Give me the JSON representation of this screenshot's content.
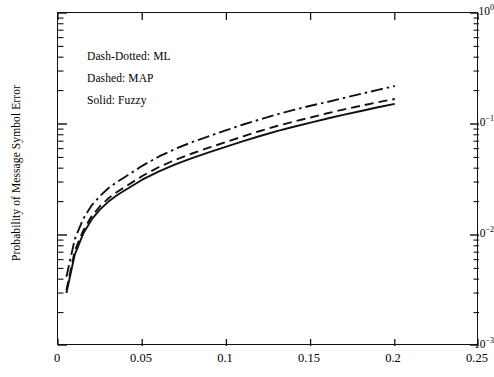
{
  "chart_data": {
    "type": "line",
    "title": "",
    "xlabel": "",
    "ylabel": "Probability of Message Symbol Error",
    "yscale": "log",
    "xscale": "linear",
    "xlim": [
      0,
      0.25
    ],
    "ylim": [
      0.001,
      1
    ],
    "xticks": [
      0,
      0.05,
      0.1,
      0.15,
      0.2,
      0.25
    ],
    "xticklabels": [
      "0",
      "0.05",
      "0.1",
      "0.15",
      "0.2",
      "0.25"
    ],
    "yticks": [
      1,
      0.1,
      0.01,
      0.001
    ],
    "yticklabels": [
      "10⁰",
      "10⁻¹",
      "10⁻²",
      "10⁻³"
    ],
    "ytick_mantissa": "10",
    "ytick_exponents": [
      "0",
      "-1",
      "-2",
      "-3"
    ],
    "grid": false,
    "minor_ticks": true,
    "legend_position": "upper-left-inside",
    "annotations": [
      "Dash-Dotted: ML",
      "Dashed: MAP",
      "Solid: Fuzzy"
    ],
    "series": [
      {
        "name": "ML",
        "style": "dash-dotted",
        "color": "#111111",
        "x": [
          0.005,
          0.01,
          0.015,
          0.02,
          0.025,
          0.03,
          0.035,
          0.04,
          0.05,
          0.06,
          0.07,
          0.08,
          0.09,
          0.1,
          0.11,
          0.12,
          0.13,
          0.14,
          0.15,
          0.16,
          0.17,
          0.18,
          0.19,
          0.2
        ],
        "y": [
          0.0042,
          0.0092,
          0.014,
          0.0185,
          0.0225,
          0.0265,
          0.03,
          0.0335,
          0.042,
          0.051,
          0.06,
          0.069,
          0.078,
          0.088,
          0.099,
          0.11,
          0.122,
          0.134,
          0.146,
          0.158,
          0.172,
          0.187,
          0.203,
          0.22
        ]
      },
      {
        "name": "MAP",
        "style": "dashed",
        "color": "#111111",
        "x": [
          0.005,
          0.01,
          0.015,
          0.02,
          0.025,
          0.03,
          0.035,
          0.04,
          0.05,
          0.06,
          0.07,
          0.08,
          0.09,
          0.1,
          0.11,
          0.12,
          0.13,
          0.14,
          0.15,
          0.16,
          0.17,
          0.18,
          0.19,
          0.2
        ],
        "y": [
          0.0032,
          0.0072,
          0.011,
          0.0148,
          0.0182,
          0.0214,
          0.0244,
          0.0272,
          0.034,
          0.041,
          0.0478,
          0.0545,
          0.0615,
          0.069,
          0.0775,
          0.0865,
          0.096,
          0.105,
          0.1145,
          0.125,
          0.1355,
          0.146,
          0.157,
          0.168
        ]
      },
      {
        "name": "Fuzzy",
        "style": "solid",
        "color": "#111111",
        "x": [
          0.005,
          0.01,
          0.015,
          0.02,
          0.025,
          0.03,
          0.035,
          0.04,
          0.05,
          0.06,
          0.07,
          0.08,
          0.09,
          0.1,
          0.11,
          0.12,
          0.13,
          0.14,
          0.15,
          0.16,
          0.17,
          0.18,
          0.19,
          0.2
        ],
        "y": [
          0.003,
          0.0067,
          0.0103,
          0.0138,
          0.017,
          0.02,
          0.0228,
          0.0254,
          0.0315,
          0.0375,
          0.0435,
          0.0495,
          0.0558,
          0.0625,
          0.07,
          0.078,
          0.0862,
          0.0945,
          0.103,
          0.112,
          0.1215,
          0.131,
          0.1415,
          0.152
        ]
      }
    ]
  }
}
